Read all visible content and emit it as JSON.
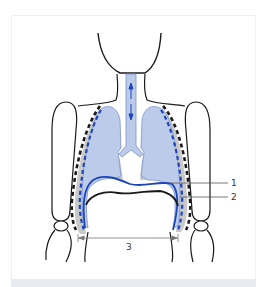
{
  "figure": {
    "labels": [
      {
        "id": "label-1",
        "text": "1"
      },
      {
        "id": "label-2",
        "text": "2"
      },
      {
        "id": "label-3",
        "text": "3"
      }
    ],
    "colors": {
      "lung_fill": "#bccbe9",
      "pleura_gray": "#c9c9c9",
      "accent_blue": "#1c45b8",
      "outline": "#1a1a1a",
      "leader_line": "#555555",
      "footer_strip": "#e8ecf1"
    }
  }
}
